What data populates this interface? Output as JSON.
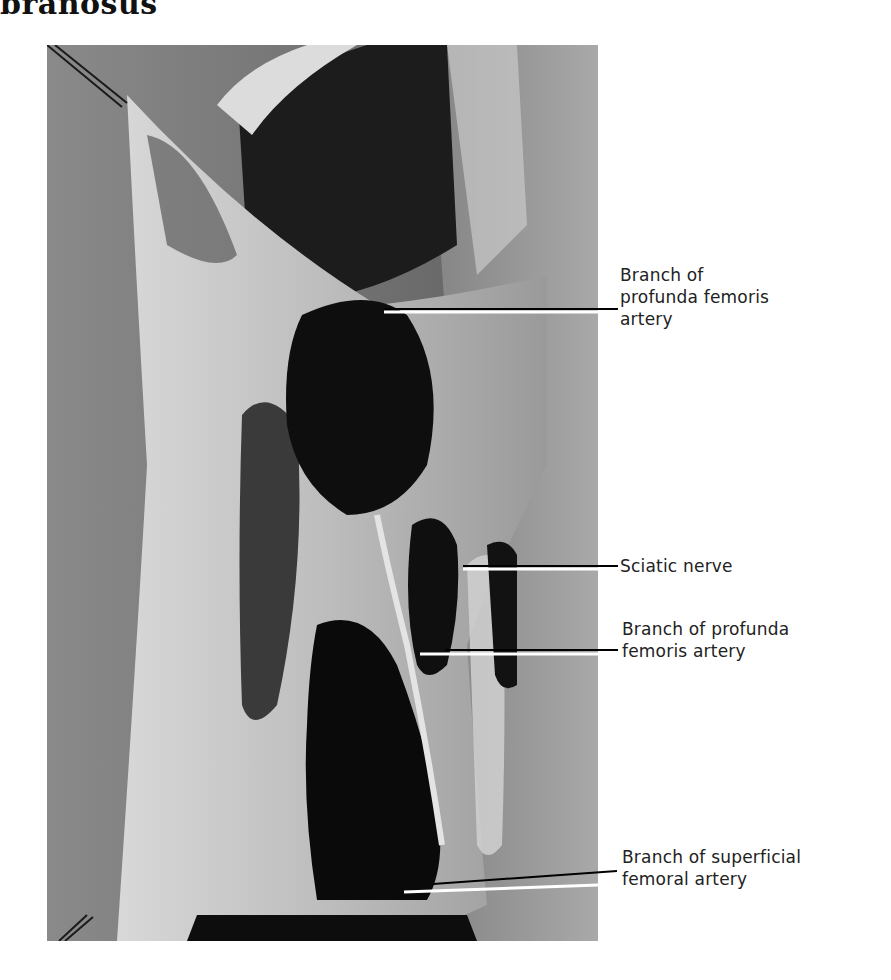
{
  "heading": "branosus",
  "figure": {
    "photo_description": "Dissection photograph (grayscale) of posterior thigh showing adductor magnus openings",
    "labels": [
      {
        "id": "branch-profunda-1",
        "lines": [
          "Branch of",
          "profunda femoris",
          "artery"
        ]
      },
      {
        "id": "sciatic-nerve",
        "lines": [
          "Sciatic nerve"
        ]
      },
      {
        "id": "branch-profunda-2",
        "lines": [
          "Branch of profunda",
          "femoris artery"
        ]
      },
      {
        "id": "branch-superficial-femoral",
        "lines": [
          "Branch of superficial",
          "femoral artery"
        ]
      }
    ]
  }
}
